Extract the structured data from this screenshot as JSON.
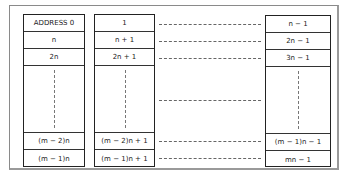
{
  "diagram": {
    "title": "",
    "left_column": {
      "cells": [
        "ADDRESS 0",
        "n",
        "2n",
        "",
        "(m − 2)n",
        "(m − 1)n"
      ]
    },
    "middle_column": {
      "cells": [
        "1",
        "n + 1",
        "2n + 1",
        "",
        "(m − 2)n + 1",
        "(m − 1)n + 1"
      ]
    },
    "right_column": {
      "cells": [
        "n − 1",
        "2n − 1",
        "3n − 1",
        "",
        "(m − 1)n − 1",
        "mn − 1"
      ]
    },
    "connectors": [
      "row-0",
      "row-1",
      "row-2",
      "ellipsis",
      "row-m-2",
      "row-m-1"
    ]
  }
}
